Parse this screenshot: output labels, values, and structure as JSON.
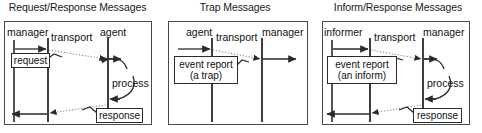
{
  "figure": {
    "type": "sequence-diagram-set",
    "background_color": "#ffffff",
    "line_color": "#2a2a2a",
    "frame_color": "#4a4a4a",
    "dotted_color": "#8a8a8a"
  },
  "panels": [
    {
      "id": "request-response",
      "title": "Request/Response Messages",
      "lifelines": [
        {
          "name": "manager",
          "label": "manager"
        },
        {
          "name": "transport",
          "label": "transport"
        },
        {
          "name": "agent",
          "label": "agent"
        }
      ],
      "messages": [
        {
          "name": "request",
          "lines": [
            "request"
          ]
        },
        {
          "name": "response",
          "lines": [
            "response"
          ]
        }
      ],
      "annotations": [
        {
          "name": "process",
          "label": "process"
        }
      ]
    },
    {
      "id": "trap",
      "title": "Trap Messages",
      "lifelines": [
        {
          "name": "agent",
          "label": "agent"
        },
        {
          "name": "transport",
          "label": "transport"
        },
        {
          "name": "manager",
          "label": "manager"
        }
      ],
      "messages": [
        {
          "name": "event-report-trap",
          "lines": [
            "event report",
            "(a trap)"
          ]
        }
      ],
      "annotations": []
    },
    {
      "id": "inform-response",
      "title": "Inform/Response Messages",
      "lifelines": [
        {
          "name": "informer",
          "label": "informer"
        },
        {
          "name": "transport",
          "label": "transport"
        },
        {
          "name": "manager",
          "label": "manager"
        }
      ],
      "messages": [
        {
          "name": "event-report-inform",
          "lines": [
            "event report",
            "(an inform)"
          ]
        },
        {
          "name": "response",
          "lines": [
            "response"
          ]
        }
      ],
      "annotations": [
        {
          "name": "process",
          "label": "process"
        }
      ]
    }
  ]
}
